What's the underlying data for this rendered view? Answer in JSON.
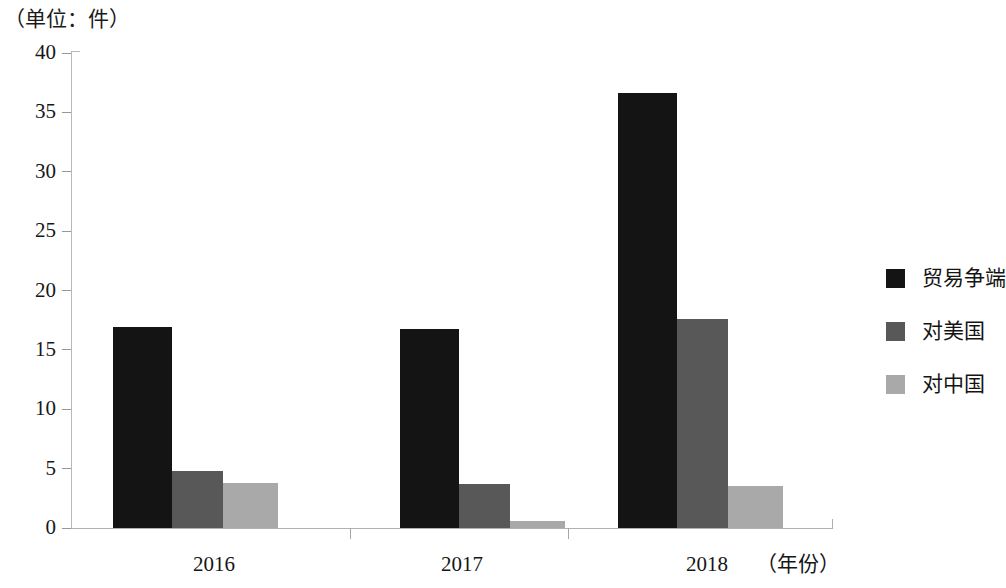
{
  "figure": {
    "unit_caption": "（单位：件）"
  },
  "chart_data": {
    "type": "bar",
    "title": "",
    "subtitle": "",
    "unit_note": "（单位：件）",
    "xlabel": "（年份）",
    "ylabel": "",
    "categories": [
      "2016",
      "2017",
      "2018"
    ],
    "series": [
      {
        "name": "贸易争端",
        "color": "#141414",
        "values": [
          16.9,
          16.8,
          36.6
        ]
      },
      {
        "name": "对美国",
        "color": "#585858",
        "values": [
          4.8,
          3.7,
          17.6
        ]
      },
      {
        "name": "对中国",
        "color": "#a9a9a9",
        "values": [
          3.8,
          0.6,
          3.5
        ]
      }
    ],
    "ylim": [
      0,
      40
    ],
    "yticks": [
      "0",
      "5",
      "10",
      "15",
      "20",
      "25",
      "30",
      "35",
      "40"
    ],
    "ytick_values": [
      0,
      5,
      10,
      15,
      20,
      25,
      30,
      35,
      40
    ],
    "xticks": [
      "2016",
      "2017",
      "2018"
    ],
    "grid": false,
    "legend_position": "right"
  },
  "axes": {
    "x_axis_title": "（年份）"
  }
}
